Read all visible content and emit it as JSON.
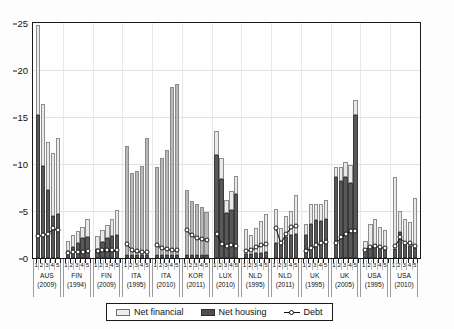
{
  "chart_data": {
    "type": "bar",
    "title": "",
    "subtitle": "",
    "xlabel": "",
    "ylabel": "",
    "ylim": [
      0,
      25
    ],
    "yticks": [
      0,
      5,
      10,
      15,
      20,
      25
    ],
    "ytick_labels": [
      "0",
      "5",
      "10",
      "15",
      "20",
      "25"
    ],
    "grid": true,
    "legend_position": "bottom-center",
    "stacked": true,
    "quintile_labels": [
      "1",
      "2",
      "3",
      "4",
      "5"
    ],
    "legend": [
      {
        "label": "Net financial",
        "key": "net_financial",
        "color": "#e9e9e9",
        "type": "bar"
      },
      {
        "label": "Net housing",
        "key": "net_housing",
        "color": "#58585a",
        "type": "bar"
      },
      {
        "label": "Debt",
        "key": "debt",
        "color": "#141414",
        "type": "line-marker"
      }
    ],
    "categories": [
      {
        "country": "AUS",
        "year": "(2009)",
        "style": "light",
        "net_housing": [
          15.2,
          9.8,
          7.2,
          4.5,
          4.7
        ],
        "net_financial": [
          9.6,
          6.6,
          5.1,
          6.7,
          8.1
        ],
        "debt": [
          2.3,
          2.4,
          2.6,
          3.2,
          3.0
        ]
      },
      {
        "country": "FIN",
        "year": "(1994)",
        "style": "light",
        "net_housing": [
          0.7,
          1.2,
          1.6,
          2.1,
          2.2
        ],
        "net_financial": [
          1.1,
          1.3,
          1.3,
          1.2,
          2.0
        ],
        "debt": [
          0.5,
          0.6,
          0.6,
          0.6,
          0.7
        ]
      },
      {
        "country": "FIN",
        "year": "(2009)",
        "style": "light",
        "net_housing": [
          1.0,
          1.7,
          2.1,
          2.3,
          2.4
        ],
        "net_financial": [
          1.3,
          1.3,
          1.4,
          1.9,
          2.7
        ],
        "debt": [
          0.7,
          0.8,
          0.8,
          0.8,
          0.8
        ]
      },
      {
        "country": "ITA",
        "year": "(1995)",
        "style": "mid",
        "net_housing": [
          0.3,
          0.3,
          0.3,
          0.3,
          0.3
        ],
        "net_financial": [
          11.6,
          8.7,
          9.0,
          9.5,
          12.5
        ],
        "debt": [
          1.5,
          0.9,
          0.7,
          0.6,
          0.6
        ]
      },
      {
        "country": "ITA",
        "year": "(2010)",
        "style": "mid",
        "net_housing": [
          0.3,
          0.3,
          0.3,
          0.3,
          0.3
        ],
        "net_financial": [
          9.4,
          10.3,
          11.2,
          17.9,
          18.2
        ],
        "debt": [
          1.4,
          1.1,
          1.0,
          0.9,
          0.8
        ]
      },
      {
        "country": "KOR",
        "year": "(2011)",
        "style": "mid",
        "net_housing": [
          0.3,
          0.3,
          0.3,
          0.3,
          0.3
        ],
        "net_financial": [
          6.9,
          5.8,
          5.4,
          5.1,
          4.6
        ],
        "debt": [
          3.0,
          2.4,
          2.1,
          2.0,
          1.9
        ]
      },
      {
        "country": "LUX",
        "year": "(2010)",
        "style": "light",
        "net_housing": [
          11.0,
          8.4,
          4.8,
          5.1,
          6.8
        ],
        "net_financial": [
          2.5,
          2.2,
          1.4,
          2.0,
          1.9
        ],
        "debt": [
          2.6,
          1.5,
          1.3,
          1.4,
          1.3
        ]
      },
      {
        "country": "NLD",
        "year": "(1995)",
        "style": "light",
        "net_housing": [
          0.4,
          0.4,
          0.5,
          0.5,
          0.6
        ],
        "net_financial": [
          2.7,
          2.0,
          2.7,
          3.4,
          4.1
        ],
        "debt": [
          0.7,
          0.9,
          1.2,
          1.4,
          1.5
        ]
      },
      {
        "country": "NLD",
        "year": "(2011)",
        "style": "light",
        "net_housing": [
          1.6,
          1.7,
          2.2,
          2.5,
          2.6
        ],
        "net_financial": [
          3.6,
          1.5,
          2.3,
          2.5,
          4.1
        ],
        "debt": [
          3.2,
          1.6,
          2.6,
          3.3,
          3.4
        ]
      },
      {
        "country": "UK",
        "year": "(1995)",
        "style": "light",
        "net_housing": [
          2.5,
          3.6,
          4.0,
          3.9,
          4.2
        ],
        "net_financial": [
          1.1,
          2.1,
          1.7,
          1.8,
          2.0
        ],
        "debt": [
          0.7,
          1.1,
          1.4,
          1.6,
          1.7
        ]
      },
      {
        "country": "UK",
        "year": "(2005)",
        "style": "light",
        "net_housing": [
          8.6,
          8.2,
          8.6,
          8.0,
          15.2
        ],
        "net_financial": [
          1.1,
          1.5,
          1.6,
          1.9,
          1.6
        ],
        "debt": [
          1.6,
          2.2,
          2.6,
          2.9,
          2.9
        ]
      },
      {
        "country": "USA",
        "year": "(1995)",
        "style": "light",
        "net_housing": [
          0.9,
          1.2,
          1.4,
          1.2,
          1.1
        ],
        "net_financial": [
          0.9,
          2.4,
          2.7,
          2.1,
          1.9
        ],
        "debt": [
          0.8,
          1.2,
          1.3,
          1.2,
          1.1
        ]
      },
      {
        "country": "USA",
        "year": "(2010)",
        "style": "light",
        "net_housing": [
          1.0,
          2.8,
          1.5,
          1.3,
          1.1
        ],
        "net_financial": [
          7.6,
          2.2,
          2.7,
          2.5,
          5.3
        ],
        "debt": [
          1.3,
          2.2,
          1.6,
          1.6,
          1.3
        ]
      }
    ]
  }
}
